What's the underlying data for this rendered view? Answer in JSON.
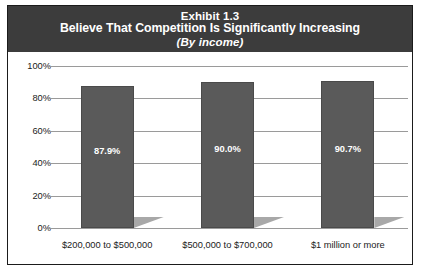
{
  "figure": {
    "title_line1": "Exhibit 1.3",
    "title_line2": "Believe That Competition Is Significantly Increasing",
    "title_line3": "(By income)",
    "band_color": "#3c3c3c",
    "bar_color": "#5a5a5a",
    "shadow_color": "#a8a8a8",
    "grid_color": "#9a9a9a",
    "border_color": "#1b1b1b"
  },
  "chart_data": {
    "type": "bar",
    "title": "Exhibit 1.3 Believe That Competition Is Significantly Increasing (By income)",
    "subtitle": "(By income)",
    "categories": [
      "$200,000 to $500,000",
      "$500,000 to $700,000",
      "$1 million or more"
    ],
    "values": [
      87.9,
      90.0,
      90.7
    ],
    "data_labels": [
      "87.9%",
      "90.0%",
      "90.7%"
    ],
    "xlabel": "",
    "ylabel": "",
    "ylim": [
      0,
      100
    ],
    "yticks": [
      0,
      20,
      40,
      60,
      80,
      100
    ],
    "ytick_labels": [
      "0%",
      "20%",
      "40%",
      "60%",
      "80%",
      "100%"
    ],
    "grid": true,
    "legend": false,
    "legend_position": "none",
    "series": [
      {
        "name": "Believe That Competition Is Significantly Increasing",
        "values": [
          87.9,
          90.0,
          90.7
        ]
      }
    ]
  }
}
